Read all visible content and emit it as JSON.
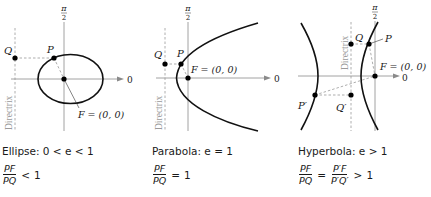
{
  "figure": {
    "colors": {
      "curve": "#111111",
      "axis": "#8a8a8a",
      "dashed": "#8a8a8a",
      "point": "#000000",
      "text": "#1a1a1a",
      "directrix_label": "#9a9a9a"
    },
    "panels": [
      {
        "id": "ellipse",
        "axis_label_top": "π/2",
        "pi_num": "π",
        "pi_den": "2",
        "axis_label_right": "0",
        "directrix_label": "Directrix",
        "points": {
          "P": "P",
          "Q": "Q"
        },
        "focus_label": "F = (0, 0)",
        "caption": "Ellipse: 0 < e < 1",
        "ratio": {
          "num": "PF",
          "den": "PQ",
          "rel": "<",
          "rhs": "1"
        }
      },
      {
        "id": "parabola",
        "axis_label_top": "π/2",
        "pi_num": "π",
        "pi_den": "2",
        "axis_label_right": "0",
        "directrix_label": "Directrix",
        "points": {
          "P": "P",
          "Q": "Q"
        },
        "focus_label": "F = (0, 0)",
        "caption": "Parabola: e = 1",
        "ratio": {
          "num": "PF",
          "den": "PQ",
          "rel": "=",
          "rhs": "1"
        }
      },
      {
        "id": "hyperbola",
        "axis_label_top": "π/2",
        "pi_num": "π",
        "pi_den": "2",
        "axis_label_right": "0",
        "directrix_label": "Directrix",
        "points": {
          "P": "P",
          "Q": "Q",
          "P_prime": "P′",
          "Q_prime": "Q′"
        },
        "focus_label": "F = (0, 0)",
        "caption": "Hyperbola: e > 1",
        "ratio": {
          "num": "PF",
          "den": "PQ",
          "rel": "=",
          "num2": "P′F",
          "den2": "P′Q′",
          "rel2": ">",
          "rhs": "1"
        }
      }
    ]
  }
}
